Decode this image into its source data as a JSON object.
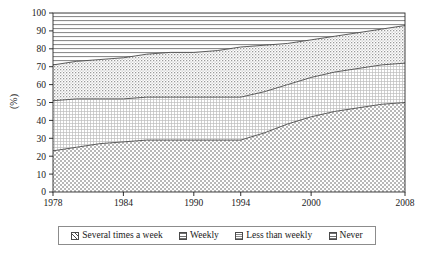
{
  "chart_data": {
    "type": "area",
    "title": "",
    "xlabel": "",
    "ylabel": "(%)",
    "stacked": true,
    "grid": false,
    "legend_position": "bottom",
    "x": [
      1978,
      1980,
      1982,
      1984,
      1986,
      1988,
      1990,
      1992,
      1994,
      1996,
      1998,
      2000,
      2002,
      2004,
      2006,
      2008
    ],
    "xlim": [
      1978,
      2008
    ],
    "ylim": [
      0,
      100
    ],
    "xticks": [
      "1978",
      "1984",
      "1990",
      "1994",
      "2000",
      "2008"
    ],
    "xtick_values": [
      1978,
      1984,
      1990,
      1994,
      2000,
      2008
    ],
    "yticks": [
      "0",
      "10",
      "20",
      "30",
      "40",
      "50",
      "60",
      "70",
      "80",
      "90",
      "100"
    ],
    "ytick_values": [
      0,
      10,
      20,
      30,
      40,
      50,
      60,
      70,
      80,
      90,
      100
    ],
    "series": [
      {
        "name": "Several times a week",
        "pattern": "diagonal-crosshatch",
        "values": [
          23,
          25,
          27,
          28,
          29,
          29,
          29,
          29,
          29,
          33,
          38,
          42,
          45,
          47,
          49,
          50
        ]
      },
      {
        "name": "Weekly",
        "pattern": "fine-grid",
        "values": [
          28,
          27,
          25,
          24,
          24,
          24,
          24,
          24,
          24,
          23,
          22,
          22,
          22,
          22,
          22,
          22
        ]
      },
      {
        "name": "Less than weekly",
        "pattern": "dotted-stipple",
        "values": [
          20,
          21,
          22,
          23,
          24,
          25,
          25,
          26,
          28,
          26,
          23,
          21,
          20,
          20,
          20,
          21
        ]
      },
      {
        "name": "Never",
        "pattern": "horizontal-lines",
        "values": [
          29,
          27,
          26,
          25,
          23,
          22,
          22,
          21,
          19,
          18,
          17,
          15,
          13,
          11,
          9,
          7
        ]
      }
    ],
    "cumulative_boundaries": {
      "note": "Upper edges of each stacked band, bottom-to-top, in percent",
      "several_times_a_week_top": [
        23,
        25,
        27,
        28,
        29,
        29,
        29,
        29,
        29,
        33,
        38,
        42,
        45,
        47,
        49,
        50
      ],
      "weekly_top": [
        51,
        52,
        52,
        52,
        53,
        53,
        53,
        53,
        53,
        56,
        60,
        64,
        67,
        69,
        71,
        72
      ],
      "less_than_weekly_top": [
        71,
        73,
        74,
        75,
        77,
        78,
        78,
        79,
        81,
        82,
        83,
        85,
        87,
        89,
        91,
        93
      ],
      "never_top": [
        100,
        100,
        100,
        100,
        100,
        100,
        100,
        100,
        100,
        100,
        100,
        100,
        100,
        100,
        100,
        100
      ]
    }
  },
  "legend": {
    "items": [
      {
        "label": "Several times a week",
        "swatch": "swatch-diagonal-crosshatch"
      },
      {
        "label": "Weekly",
        "swatch": "swatch-fine-grid"
      },
      {
        "label": "Less than weekly",
        "swatch": "swatch-dotted-stipple"
      },
      {
        "label": "Never",
        "swatch": "swatch-horizontal-lines"
      }
    ]
  },
  "axis": {
    "y_title": "(%)"
  },
  "colors": {
    "line": "#4a4a4a",
    "axis": "#1a1a1a",
    "text": "#1a1a1a",
    "legend_border": "#8c8c8c",
    "background": "#ffffff"
  }
}
